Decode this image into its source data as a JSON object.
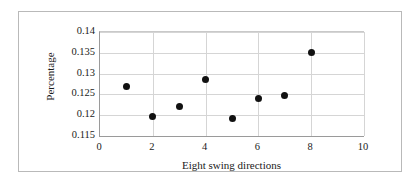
{
  "chart_data": {
    "type": "scatter",
    "title": "",
    "xlabel": "Eight swing directions",
    "ylabel": "Percentage",
    "xlim": [
      0,
      10
    ],
    "ylim": [
      0.115,
      0.14
    ],
    "xticks": [
      "0",
      "2",
      "4",
      "6",
      "8",
      "10"
    ],
    "xtick_values": [
      0,
      2,
      4,
      6,
      8,
      10
    ],
    "yticks": [
      "0.115",
      "0.12",
      "0.125",
      "0.13",
      "0.135",
      "0.14"
    ],
    "ytick_values": [
      0.115,
      0.12,
      0.125,
      0.13,
      0.135,
      0.14
    ],
    "grid": true,
    "legend": "none",
    "marker": {
      "shape": "circle",
      "color": "#111111",
      "size": 7
    },
    "series": [
      {
        "name": "Percentage by swing direction",
        "x": [
          1,
          2,
          3,
          4,
          5,
          6,
          7,
          8
        ],
        "values": [
          0.127,
          0.1198,
          0.1221,
          0.1285,
          0.1193,
          0.124,
          0.1247,
          0.1351
        ]
      }
    ]
  },
  "colors": {
    "frame": "#b9b9b9",
    "axis": "#9a9a9a",
    "grid": "#d5d5d5",
    "marker": "#111111",
    "background": "#ffffff"
  }
}
